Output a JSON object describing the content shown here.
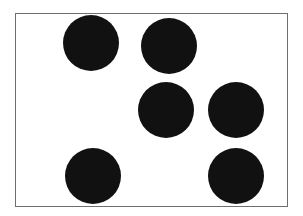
{
  "diagram": {
    "type": "dot-pattern",
    "frame": {
      "x": 15,
      "y": 13,
      "width": 272,
      "height": 193,
      "stroke": "#6e6e6e"
    },
    "dot_color": "#111111",
    "dot_count": 6,
    "dots": [
      {
        "cx": 91,
        "cy": 43,
        "r": 28
      },
      {
        "cx": 169,
        "cy": 46,
        "r": 28
      },
      {
        "cx": 166,
        "cy": 110,
        "r": 28
      },
      {
        "cx": 236,
        "cy": 110,
        "r": 28
      },
      {
        "cx": 93,
        "cy": 176,
        "r": 28
      },
      {
        "cx": 236,
        "cy": 176,
        "r": 28
      }
    ]
  }
}
